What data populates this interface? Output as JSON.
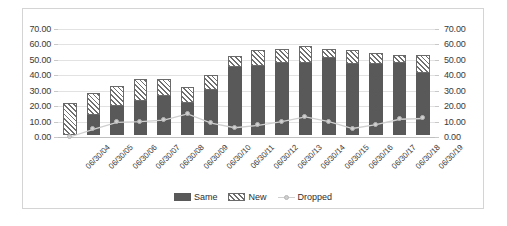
{
  "chart_data": {
    "type": "bar",
    "title": "",
    "subtitle": "",
    "xlabel": "",
    "ylabel": "",
    "ylim": [
      0,
      70
    ],
    "ytick_step": 10,
    "ytick_labels": [
      "70.00",
      "60.00",
      "50.00",
      "40.00",
      "30.00",
      "20.00",
      "10.00",
      "0.00"
    ],
    "ytick_labels_right": [
      "70.00",
      "60.00",
      "50.00",
      "40.00",
      "30.00",
      "20.00",
      "10.00",
      "0.00"
    ],
    "grid": true,
    "legend_position": "bottom",
    "stacked": true,
    "categories": [
      "06/30/04",
      "06/30/05",
      "06/30/06",
      "06/30/07",
      "06/30/08",
      "06/30/09",
      "06/30/10",
      "06/30/11",
      "06/30/12",
      "06/30/13",
      "06/30/14",
      "06/30/15",
      "06/30/16",
      "06/30/17",
      "06/30/18",
      "06/30/19"
    ],
    "series": [
      {
        "name": "Same",
        "kind": "bar",
        "fill": "solid-dark-gray",
        "color": "#595959",
        "values": [
          0,
          13,
          19,
          22,
          25,
          21,
          29,
          44,
          45,
          47,
          47,
          50,
          46,
          46,
          47,
          40
        ]
      },
      {
        "name": "New",
        "kind": "bar",
        "fill": "diagonal-hatch",
        "color": "#6f6f6f",
        "values": [
          21,
          14,
          13,
          14,
          11,
          10,
          10,
          7,
          10,
          9,
          11,
          6,
          9,
          7,
          5,
          12
        ]
      },
      {
        "name": "Dropped",
        "kind": "line",
        "marker": "circle",
        "color": "#cfcfcf",
        "values": [
          0,
          5,
          9.5,
          10,
          11,
          15,
          9,
          6,
          7.5,
          10,
          13,
          10,
          5.5,
          8,
          11.5,
          12
        ]
      }
    ],
    "stack_totals": [
      21,
      27,
      32,
      36,
      36,
      31,
      39,
      51,
      55,
      56,
      58,
      56,
      55,
      53,
      52,
      52
    ]
  },
  "legend": {
    "items": [
      {
        "label": "Same"
      },
      {
        "label": "New"
      },
      {
        "label": "Dropped"
      }
    ]
  }
}
